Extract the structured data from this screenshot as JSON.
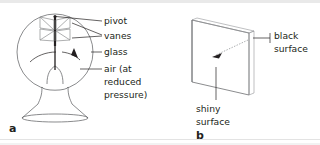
{
  "figure": {
    "background_color": "#ffffff",
    "line_color": "#58595b",
    "text_color": "#231f20",
    "accent_gray": "#939598"
  },
  "panel_a": {
    "letter": "a",
    "subject": "crookes-radiometer",
    "labels": {
      "pivot": "pivot",
      "vanes": "vanes",
      "glass": "glass",
      "air_line1": "air (at",
      "air_line2": "reduced",
      "air_line3": "pressure)"
    }
  },
  "panel_b": {
    "letter": "b",
    "subject": "single-vane-plate",
    "labels": {
      "black_line1": "black",
      "black_line2": "surface",
      "shiny_line1": "shiny",
      "shiny_line2": "surface"
    }
  }
}
